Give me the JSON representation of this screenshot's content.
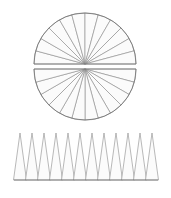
{
  "figure": {
    "background_color": "#ffffff",
    "stroke_color": "#8a8a8a",
    "outline_color": "#707070",
    "fill_color": "#fbfbfb",
    "stroke_width": 0.6,
    "outline_width": 0.8
  },
  "circle_figure": {
    "name": "sectored-circle",
    "center_x": 85,
    "radius": 51,
    "sector_count_total": 24,
    "sector_count_per_half": 12,
    "upper_half": {
      "label": "upper-half-disc",
      "center_y": 64,
      "start_angle_deg": 180,
      "end_angle_deg": 360
    },
    "lower_half": {
      "label": "lower-half-disc",
      "center_y": 69,
      "start_angle_deg": 0,
      "end_angle_deg": 180
    },
    "gap_px": 5
  },
  "triangle_figure": {
    "name": "rearranged-triangle-row",
    "triangle_count": 12,
    "left_x": 14,
    "right_x": 158,
    "baseline_y": 180,
    "apex_y": 133,
    "base_width": 12,
    "overlap": 0.5
  },
  "chart_data": {
    "type": "diagram",
    "elements": [
      {
        "name": "sectored-circle",
        "shape": "circle",
        "sectors": 24,
        "split_into_halves": true,
        "center": [
          85,
          66.5
        ],
        "radius": 51
      },
      {
        "name": "triangle-row",
        "shape": "triangle-strip",
        "count": 12,
        "base_width": 12,
        "height": 47,
        "baseline_y": 180
      }
    ]
  }
}
